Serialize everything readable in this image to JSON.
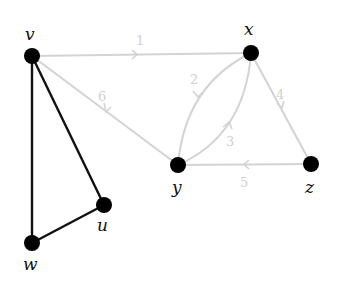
{
  "diagram": {
    "type": "graph",
    "colors": {
      "node": "#000000",
      "tree_edge": "#111111",
      "faded_edge": "#d3d3d3",
      "faded_label": "#cfcfcf"
    },
    "nodes": [
      {
        "id": "v",
        "label": "v",
        "x": 32,
        "y": 56
      },
      {
        "id": "x",
        "label": "x",
        "x": 251,
        "y": 53
      },
      {
        "id": "y",
        "label": "y",
        "x": 178,
        "y": 165
      },
      {
        "id": "z",
        "label": "z",
        "x": 311,
        "y": 164
      },
      {
        "id": "u",
        "label": "u",
        "x": 104,
        "y": 205
      },
      {
        "id": "w",
        "label": "w",
        "x": 32,
        "y": 243
      }
    ],
    "directed_edges": [
      {
        "from": "v",
        "to": "x",
        "weight": "1"
      },
      {
        "from": "x",
        "to": "y",
        "weight": "2"
      },
      {
        "from": "y",
        "to": "x",
        "weight": "3"
      },
      {
        "from": "x",
        "to": "z",
        "weight": "4"
      },
      {
        "from": "z",
        "to": "y",
        "weight": "5"
      },
      {
        "from": "y",
        "to": "v",
        "weight": "6"
      }
    ],
    "undirected_edges": [
      {
        "from": "v",
        "to": "w"
      },
      {
        "from": "v",
        "to": "u"
      },
      {
        "from": "u",
        "to": "w"
      }
    ]
  }
}
